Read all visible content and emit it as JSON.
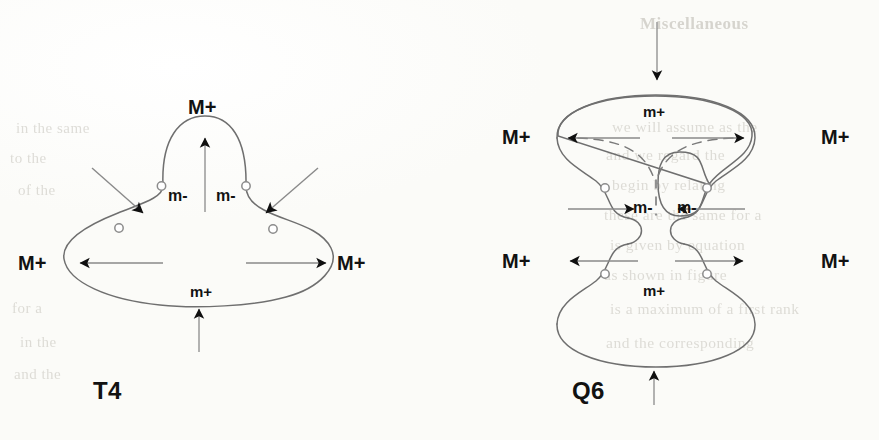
{
  "page": {
    "kind": "scanned-figure-page",
    "background_color": "#fdfdfb",
    "ink_color": "#121212",
    "curve_color": "#6f6f6f",
    "marker_color": "#8c8c8c"
  },
  "bleed_through_text": {
    "note": "faint illegible show-through from the reverse side of the scanned page",
    "right_column_lines": [
      "Miscellaneous",
      "we will assume as the",
      "and we regard the",
      "begin by relating",
      "these are the same for a",
      "is given by equation",
      "as shown in figure",
      "is a maximum of a first rank",
      "and the corresponding"
    ],
    "left_column_lines": [
      "in the same",
      "to the",
      "of the",
      "for a",
      "in the",
      "and the"
    ]
  },
  "figures": [
    {
      "id": "T4",
      "caption": "T4",
      "shape": "bell / mushroom closed curve — dome lobe above a wide flattened ellipse",
      "labels": [
        {
          "text": "M+",
          "role": "maximum",
          "position": "top"
        },
        {
          "text": "m-",
          "role": "saddle",
          "position": "upper-left-waist"
        },
        {
          "text": "m-",
          "role": "saddle",
          "position": "upper-right-waist"
        },
        {
          "text": "M+",
          "role": "maximum",
          "position": "left"
        },
        {
          "text": "M+",
          "role": "maximum",
          "position": "right"
        },
        {
          "text": "m+",
          "role": "minimum",
          "position": "bottom-inside"
        }
      ],
      "arrows": [
        {
          "name": "top-arrow",
          "direction": "up",
          "style": "solid"
        },
        {
          "name": "upper-left-arrow",
          "direction": "down-right",
          "style": "solid"
        },
        {
          "name": "upper-right-arrow",
          "direction": "down-left",
          "style": "solid"
        },
        {
          "name": "left-arrow",
          "direction": "left",
          "style": "solid"
        },
        {
          "name": "right-arrow",
          "direction": "right",
          "style": "solid"
        },
        {
          "name": "bottom-arrow",
          "direction": "up",
          "style": "solid"
        }
      ],
      "inflection_markers": 4
    },
    {
      "id": "Q6",
      "caption": "Q6",
      "shape": "peanut / bowtie closed curve — two stacked lobes pinched at a central waist, with dashed internal separatrix forming a Y",
      "labels": [
        {
          "text": "m+",
          "role": "minimum",
          "position": "upper-lobe-inside-top"
        },
        {
          "text": "M+",
          "role": "maximum",
          "position": "upper-left"
        },
        {
          "text": "M+",
          "role": "maximum",
          "position": "upper-right"
        },
        {
          "text": "m-",
          "role": "saddle",
          "position": "waist-left"
        },
        {
          "text": "m-",
          "role": "saddle",
          "position": "waist-right"
        },
        {
          "text": "M+",
          "role": "maximum",
          "position": "lower-left"
        },
        {
          "text": "M+",
          "role": "maximum",
          "position": "lower-right"
        },
        {
          "text": "m+",
          "role": "minimum",
          "position": "lower-lobe-inside-bottom"
        }
      ],
      "arrows": [
        {
          "name": "top-arrow",
          "direction": "down",
          "style": "solid"
        },
        {
          "name": "upper-left-arrow",
          "direction": "left",
          "style": "solid"
        },
        {
          "name": "upper-right-arrow",
          "direction": "right",
          "style": "solid"
        },
        {
          "name": "waist-left-arrow",
          "direction": "right",
          "style": "solid"
        },
        {
          "name": "waist-right-arrow",
          "direction": "left",
          "style": "solid"
        },
        {
          "name": "lower-left-arrow",
          "direction": "left",
          "style": "solid"
        },
        {
          "name": "lower-right-arrow",
          "direction": "right",
          "style": "solid"
        },
        {
          "name": "bottom-arrow",
          "direction": "up",
          "style": "solid"
        }
      ],
      "dashed_separatrix": true,
      "inflection_markers": 4
    }
  ]
}
